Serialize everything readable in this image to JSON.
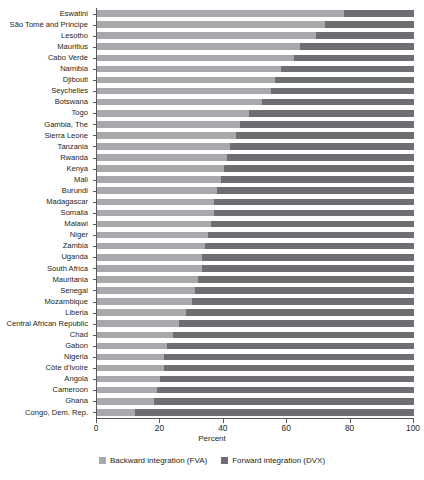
{
  "chart_data": {
    "type": "bar",
    "orientation": "horizontal",
    "stacked": true,
    "stack_total": 100,
    "title": "",
    "xlabel": "Percent",
    "ylabel": "",
    "xlim": [
      0,
      100
    ],
    "xticks": [
      0,
      20,
      40,
      60,
      80,
      100
    ],
    "xtick_labels": [
      "0",
      "20",
      "40",
      "60",
      "80",
      "100"
    ],
    "grid": false,
    "legend_position": "bottom",
    "legend": [
      "Backward integration (FVA)",
      "Forward integration (DVX)"
    ],
    "colors": {
      "backward_fva": "#a7a9ac",
      "forward_dvx": "#6d6e71",
      "axis": "#58595b",
      "text": "#231f20",
      "background": "#ffffff"
    },
    "categories": [
      "Eswatini",
      "São Tomé and Principe",
      "Lesotho",
      "Mauritius",
      "Cabo Verde",
      "Namibia",
      "Djibouti",
      "Seychelles",
      "Botswana",
      "Togo",
      "Gambia, The",
      "Sierra Leone",
      "Tanzania",
      "Rwanda",
      "Kenya",
      "Mali",
      "Burundi",
      "Madagascar",
      "Somalia",
      "Malawi",
      "Niger",
      "Zambia",
      "Uganda",
      "South Africa",
      "Mauritania",
      "Senegal",
      "Mozambique",
      "Liberia",
      "Central African Republic",
      "Chad",
      "Gabon",
      "Nigeria",
      "Côte d'Ivoire",
      "Angola",
      "Cameroon",
      "Ghana",
      "Congo, Dem. Rep."
    ],
    "series": [
      {
        "name": "Backward integration (FVA)",
        "color": "#a7a9ac",
        "values": [
          78,
          72,
          69,
          64,
          62,
          58,
          56,
          55,
          52,
          48,
          45,
          44,
          42,
          41,
          40,
          39,
          38,
          37,
          37,
          36,
          35,
          34,
          33,
          33,
          32,
          31,
          30,
          28,
          26,
          24,
          22,
          21,
          21,
          20,
          19,
          18,
          12
        ]
      },
      {
        "name": "Forward integration (DVX)",
        "color": "#6d6e71",
        "values": [
          22,
          28,
          31,
          36,
          38,
          42,
          44,
          45,
          48,
          52,
          55,
          56,
          58,
          59,
          60,
          61,
          62,
          63,
          63,
          64,
          65,
          66,
          67,
          67,
          68,
          69,
          70,
          72,
          74,
          76,
          78,
          79,
          79,
          80,
          81,
          82,
          88
        ]
      }
    ]
  }
}
